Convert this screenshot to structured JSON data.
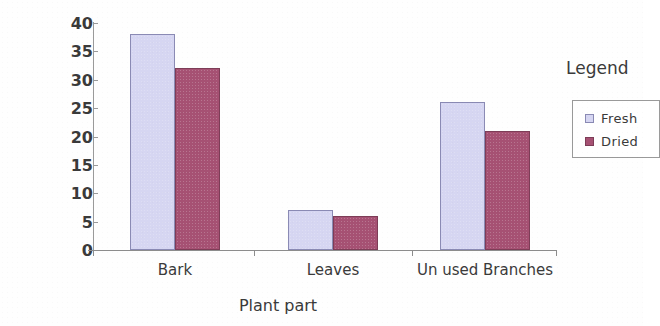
{
  "chart_data": {
    "type": "bar",
    "title": "",
    "xlabel": "Plant part",
    "ylabel": "Biomass (Kg)",
    "categories": [
      "Bark",
      "Leaves",
      "Un used Branches"
    ],
    "series": [
      {
        "name": "Fresh",
        "color": "#d6d6f2",
        "values": [
          38,
          7,
          26
        ]
      },
      {
        "name": "Dried",
        "color": "#a65173",
        "values": [
          32,
          6,
          21
        ]
      }
    ],
    "ylim": [
      0,
      40
    ],
    "yticks": [
      0,
      5,
      10,
      15,
      20,
      25,
      30,
      35,
      40
    ],
    "ytick_labels": [
      "0",
      "5",
      "10",
      "15",
      "20",
      "25",
      "30",
      "35",
      "40"
    ],
    "grid": false,
    "legend": {
      "title": "Legend",
      "position": "right",
      "entries": [
        {
          "label": "Fresh",
          "swatch": "fresh-swatch-icon"
        },
        {
          "label": "Dried",
          "swatch": "dried-swatch-icon"
        }
      ]
    }
  }
}
